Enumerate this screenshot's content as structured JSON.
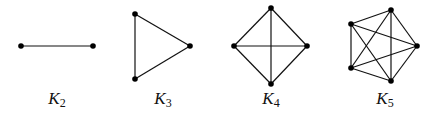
{
  "graphs": [
    {
      "name": "K",
      "subscript": "2",
      "label_x": 57,
      "nodes": [
        [
          21,
          46
        ],
        [
          93,
          46
        ]
      ],
      "edges": [
        [
          0,
          1
        ]
      ]
    },
    {
      "name": "K",
      "subscript": "3",
      "label_x": 163,
      "nodes": [
        [
          135,
          14
        ],
        [
          190,
          46
        ],
        [
          135,
          79
        ]
      ],
      "edges": [
        [
          0,
          1
        ],
        [
          1,
          2
        ],
        [
          2,
          0
        ]
      ]
    },
    {
      "name": "K",
      "subscript": "4",
      "label_x": 271,
      "nodes": [
        [
          271,
          8
        ],
        [
          234,
          46
        ],
        [
          307,
          46
        ],
        [
          271,
          84
        ]
      ],
      "edges": [
        [
          0,
          1
        ],
        [
          0,
          2
        ],
        [
          0,
          3
        ],
        [
          1,
          2
        ],
        [
          1,
          3
        ],
        [
          2,
          3
        ]
      ]
    },
    {
      "name": "K",
      "subscript": "5",
      "label_x": 385,
      "nodes": [
        [
          391,
          10
        ],
        [
          351,
          24
        ],
        [
          417,
          46
        ],
        [
          351,
          68
        ],
        [
          391,
          81
        ]
      ],
      "edges": [
        [
          0,
          1
        ],
        [
          0,
          2
        ],
        [
          0,
          3
        ],
        [
          0,
          4
        ],
        [
          1,
          2
        ],
        [
          1,
          3
        ],
        [
          1,
          4
        ],
        [
          2,
          3
        ],
        [
          2,
          4
        ],
        [
          3,
          4
        ]
      ]
    }
  ],
  "colors": {
    "edge": "#111111",
    "node": "#000000",
    "background": "#ffffff"
  }
}
